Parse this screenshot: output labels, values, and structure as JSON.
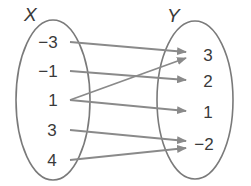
{
  "diagram": {
    "type": "mapping-diagram",
    "domain": {
      "title": "X",
      "elements": [
        "−3",
        "−1",
        "1",
        "3",
        "4"
      ]
    },
    "range": {
      "title": "Y",
      "elements": [
        "3",
        "2",
        "1",
        "−2"
      ]
    },
    "mappings": [
      {
        "from": "−3",
        "to": "3"
      },
      {
        "from": "−1",
        "to": "2"
      },
      {
        "from": "1",
        "to": "3"
      },
      {
        "from": "1",
        "to": "1"
      },
      {
        "from": "3",
        "to": "−2"
      },
      {
        "from": "4",
        "to": "−2"
      }
    ],
    "colors": {
      "outline": "#7a7a7a",
      "arrow": "#8a8a8a",
      "text": "#3a3a3a"
    }
  }
}
